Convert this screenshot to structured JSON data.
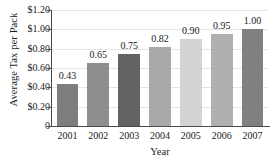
{
  "chart_data": {
    "type": "bar",
    "title": "",
    "xlabel": "Year",
    "ylabel": "Average Tax per Pack",
    "categories": [
      "2001",
      "2002",
      "2003",
      "2004",
      "2005",
      "2006",
      "2007"
    ],
    "values": [
      0.43,
      0.65,
      0.75,
      0.82,
      0.9,
      0.95,
      1.0
    ],
    "data_labels": [
      "0.43",
      "0.65",
      "0.75",
      "0.82",
      "0.90",
      "0.95",
      "1.00"
    ],
    "ylim": [
      0,
      1.2
    ],
    "ytick_values": [
      1.2,
      1.0,
      0.8,
      0.6,
      0.4,
      0.2,
      0
    ],
    "ytick_labels": [
      "$1.20",
      "$1.00",
      "$0.80",
      "$0.60",
      "$0.40",
      "$0.20",
      "0"
    ],
    "grid": true,
    "legend": "none",
    "bar_colors": [
      "#7e7e7e",
      "#8e8e8e",
      "#636363",
      "#a9a9a9",
      "#d3d3d3",
      "#b0b0b0",
      "#808080"
    ],
    "axis_color": "#4a4a4a",
    "grid_color": "#e3e3e3",
    "background": "#ffffff"
  }
}
